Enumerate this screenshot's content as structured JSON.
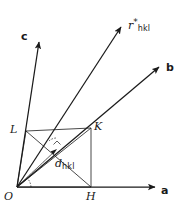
{
  "figure": {
    "background_color": "#ffffff",
    "stroke_color": "#1a1a1a",
    "width": 179,
    "height": 209
  },
  "axes": [
    {
      "id": "c-axis",
      "label": "c",
      "label_x": 21,
      "label_y": 31,
      "from": [
        17,
        187
      ],
      "to": [
        39,
        39
      ]
    },
    {
      "id": "b-axis",
      "label": "b",
      "label_x": 166,
      "label_y": 68,
      "from": [
        17,
        187
      ],
      "to": [
        162,
        64
      ]
    },
    {
      "id": "a-axis",
      "label": "a",
      "label_x": 161,
      "label_y": 190,
      "from": [
        17,
        187
      ],
      "to": [
        160,
        187
      ]
    }
  ],
  "vectors": [
    {
      "id": "r-star-hkl",
      "label_base": "r",
      "label_superscript": "*",
      "label_subscript": "hkl",
      "label_x": 128,
      "label_y": 22,
      "from": [
        17,
        187
      ],
      "to": [
        124,
        23
      ],
      "description": "reciprocal lattice vector normal to the hkl plane"
    },
    {
      "id": "d-hkl",
      "label_base": "d",
      "label_superscript": "",
      "label_subscript": "hkl",
      "label_x": 55,
      "label_y": 163,
      "from": [
        17,
        187
      ],
      "to": [
        57,
        149
      ],
      "description": "interplanar spacing from origin to the hkl plane"
    }
  ],
  "points": [
    {
      "id": "point-L",
      "label": "L",
      "x": 26,
      "y": 131,
      "label_x": 10,
      "label_y": 126
    },
    {
      "id": "point-K",
      "label": "K",
      "x": 91,
      "y": 128,
      "label_x": 94,
      "label_y": 124
    },
    {
      "id": "point-H",
      "label": "H",
      "x": 91,
      "y": 187,
      "label_x": 87,
      "label_y": 191
    },
    {
      "id": "point-O",
      "label": "O",
      "x": 17,
      "y": 187,
      "label_x": 4,
      "label_y": 191
    }
  ],
  "plane_outline": {
    "id": "hkl-plane-triangle",
    "vertices": [
      [
        26,
        131
      ],
      [
        91,
        128
      ],
      [
        91,
        187
      ]
    ],
    "note": "trace of the (hkl) plane intercepting the axes at L, K and H"
  },
  "construction_lines": [
    {
      "id": "line-O-K",
      "from": [
        17,
        187
      ],
      "to": [
        91,
        128
      ]
    },
    {
      "id": "line-O-H",
      "from": [
        17,
        187
      ],
      "to": [
        91,
        187
      ]
    },
    {
      "id": "line-L-H",
      "from": [
        26,
        131
      ],
      "to": [
        91,
        187
      ]
    },
    {
      "id": "line-L-K",
      "from": [
        26,
        131
      ],
      "to": [
        91,
        128
      ]
    },
    {
      "id": "line-K-H",
      "from": [
        91,
        128
      ],
      "to": [
        91,
        187
      ]
    }
  ],
  "angle_marks": [
    {
      "id": "angle-at-origin",
      "cx": 17,
      "cy": 187,
      "radius": 13,
      "note": "angle between d-hkl and the a axis"
    },
    {
      "id": "angle-at-foot",
      "cx": 57,
      "cy": 149,
      "radius": 11,
      "note": "right angle where d-hkl meets the hkl plane"
    }
  ]
}
